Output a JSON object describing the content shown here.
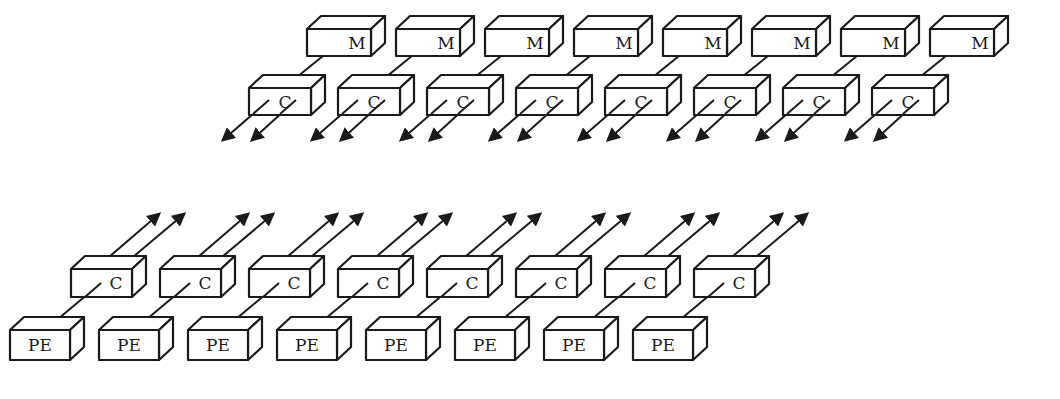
{
  "diagram": {
    "title": "",
    "memory_modules": {
      "label": "M",
      "count": 8,
      "items": [
        "M",
        "M",
        "M",
        "M",
        "M",
        "M",
        "M",
        "M"
      ]
    },
    "memory_side_connectors": {
      "label": "C",
      "count": 8,
      "items": [
        "C",
        "C",
        "C",
        "C",
        "C",
        "C",
        "C",
        "C"
      ],
      "arrows_per_connector": 2,
      "arrow_direction": "down-left"
    },
    "processor_side_connectors": {
      "label": "C",
      "count": 8,
      "items": [
        "C",
        "C",
        "C",
        "C",
        "C",
        "C",
        "C",
        "C"
      ],
      "arrows_per_connector": 2,
      "arrow_direction": "up-right"
    },
    "processing_elements": {
      "label": "PE",
      "count": 8,
      "items": [
        "PE",
        "PE",
        "PE",
        "PE",
        "PE",
        "PE",
        "PE",
        "PE"
      ]
    },
    "colors": {
      "stroke": "#1a1a1a",
      "background": "#ffffff"
    }
  }
}
